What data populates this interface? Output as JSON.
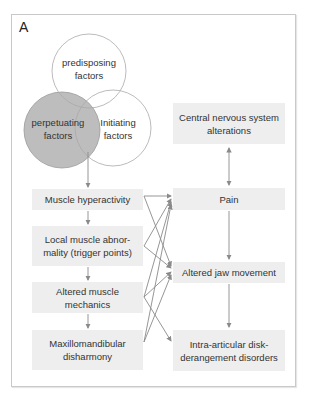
{
  "panel_label": "A",
  "venn": {
    "top": {
      "label_line1": "predisposing",
      "label_line2": "factors",
      "fill": "#ffffff"
    },
    "left": {
      "label_line1": "perpetuating",
      "label_line2": "factors",
      "fill": "#bdbdbd"
    },
    "right": {
      "label_line1": "Initiating",
      "label_line2": "factors",
      "fill": "#ffffff"
    }
  },
  "left_column": [
    {
      "label": "Muscle hyperactivity"
    },
    {
      "label": "Local muscle abnor-\nmality (trigger points)"
    },
    {
      "label": "Altered muscle\nmechanics"
    },
    {
      "label": "Maxillomandibular\ndisharmony"
    }
  ],
  "right_column": [
    {
      "label": "Central nervous system\nalterations"
    },
    {
      "label": "Pain"
    },
    {
      "label": "Altered jaw movement"
    },
    {
      "label": "Intra-articular disk-\nderangement disorders"
    }
  ],
  "colors": {
    "box_fill": "#eeeeee",
    "line": "#8a8a8a",
    "shaded_circle": "#bdbdbd"
  }
}
